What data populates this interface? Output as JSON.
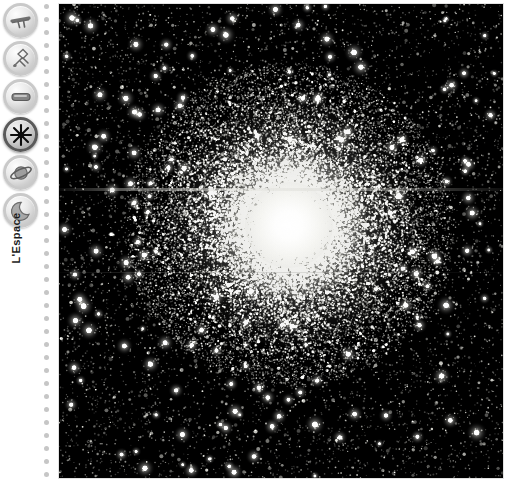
{
  "app": {
    "background_color": "#ffffff"
  },
  "sidebar": {
    "label": "L'Espace",
    "divider": {
      "style": "dotted",
      "dot_color": "#c6c6c6",
      "dot_count": 37
    },
    "items": [
      {
        "icon": "telescope-icon",
        "label": "Telescope",
        "active": false
      },
      {
        "icon": "satellite-icon",
        "label": "Satellite",
        "active": false
      },
      {
        "icon": "capsule-icon",
        "label": "Capsule",
        "active": false
      },
      {
        "icon": "star-burst-icon",
        "label": "Etoiles",
        "active": true
      },
      {
        "icon": "ringed-planet-icon",
        "label": "Planete",
        "active": false
      },
      {
        "icon": "moon-icon",
        "label": "Lune",
        "active": false
      }
    ]
  },
  "viewer": {
    "name": "image-viewer",
    "subject": "globular-star-cluster",
    "background_color": "#000000",
    "core": {
      "x": 230,
      "y": 221,
      "brightness": 1.0
    },
    "artifacts": [
      {
        "type": "horizontal-scanline",
        "y": 185
      },
      {
        "type": "horizontal-scanline",
        "y": 268
      }
    ]
  }
}
